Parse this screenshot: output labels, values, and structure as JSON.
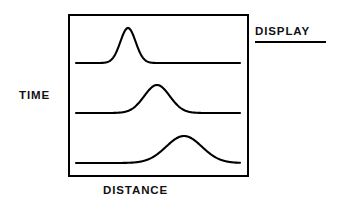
{
  "figure": {
    "name": "display-time-distance-pulse-diagram",
    "background_color": "#ffffff",
    "line_color": "#000000"
  },
  "labels": {
    "y_axis": "TIME",
    "x_axis": "DISTANCE",
    "annotation": "DISPLAY"
  },
  "plot_box": {
    "x": 68,
    "y": 14,
    "width": 181,
    "height": 163,
    "border_width": 2,
    "border_color": "#000000"
  },
  "chart_data": {
    "type": "line",
    "title": "",
    "xlabel": "DISTANCE",
    "ylabel": "TIME",
    "annotations": [
      "DISPLAY"
    ],
    "grid": false,
    "legend": false,
    "axis_ticks": false,
    "xlim": [
      0,
      1
    ],
    "trace_count": 3,
    "series": [
      {
        "name": "trace-1-early-time",
        "baseline_y": 63,
        "peak_center_x": 128,
        "peak_top_y": 28,
        "amplitude_px": 35,
        "half_width_px": 9,
        "x_start": 76,
        "x_end": 240
      },
      {
        "name": "trace-2-mid-time",
        "baseline_y": 113,
        "peak_center_x": 157,
        "peak_top_y": 85,
        "amplitude_px": 28,
        "half_width_px": 15,
        "x_start": 76,
        "x_end": 240
      },
      {
        "name": "trace-3-late-time",
        "baseline_y": 163,
        "peak_center_x": 184,
        "peak_top_y": 136,
        "amplitude_px": 27,
        "half_width_px": 21,
        "x_start": 76,
        "x_end": 240
      }
    ]
  }
}
